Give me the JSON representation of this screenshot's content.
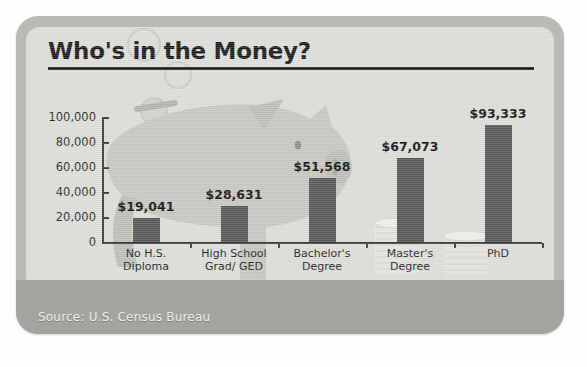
{
  "title": "Who's in the Money?",
  "source": "Source: U.S. Census Bureau",
  "artwork": {
    "piggy_bank": "piggy-bank-illustration",
    "coins": "coin-stack-illustration"
  },
  "colors": {
    "bar": "#565656",
    "panel": "#dcdcd7",
    "frame": "#b9b9b6",
    "footer_band": "#a3a39f",
    "axis": "#3a3a3a",
    "title_text": "#1a1a1a",
    "source_text": "#efefec",
    "piggy": "#c6c6c0",
    "coin": "#e8e8e3"
  },
  "chart_data": {
    "type": "bar",
    "title": "Who's in the Money?",
    "xlabel": "",
    "ylabel": "",
    "ylim": [
      0,
      100000
    ],
    "yticks": [
      0,
      20000,
      40000,
      60000,
      80000,
      100000
    ],
    "ytick_labels": [
      "0",
      "20,000",
      "40,000",
      "60,000",
      "80,000",
      "100,000"
    ],
    "grid": false,
    "legend": "none",
    "categories": [
      "No H.S. Diploma",
      "High School Grad/ GED",
      "Bachelor's Degree",
      "Master's Degree",
      "PhD"
    ],
    "category_lines": [
      [
        "No H.S.",
        "Diploma"
      ],
      [
        "High School",
        "Grad/ GED"
      ],
      [
        "Bachelor's",
        "Degree"
      ],
      [
        "Master's",
        "Degree"
      ],
      [
        "PhD",
        ""
      ]
    ],
    "values": [
      19041,
      28631,
      51568,
      67073,
      93333
    ],
    "value_labels": [
      "$19,041",
      "$28,631",
      "$51,568",
      "$67,073",
      "$93,333"
    ],
    "source": "Source: U.S. Census Bureau"
  }
}
